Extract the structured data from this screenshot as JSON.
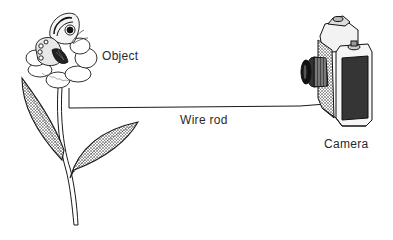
{
  "diagram": {
    "type": "illustration",
    "labels": {
      "object": "Object",
      "wire": "Wire rod",
      "camera": "Camera"
    },
    "elements": [
      {
        "id": "object",
        "icon": "flower-with-butterfly-icon",
        "label": "Object"
      },
      {
        "id": "wire",
        "icon": "wire-rod-line",
        "label": "Wire rod"
      },
      {
        "id": "camera",
        "icon": "slr-camera-icon",
        "label": "Camera"
      }
    ],
    "connections": [
      {
        "from": "object",
        "to": "camera",
        "via": "Wire rod"
      }
    ],
    "colors": {
      "ink": "#1a1a1a",
      "background": "#ffffff"
    }
  }
}
